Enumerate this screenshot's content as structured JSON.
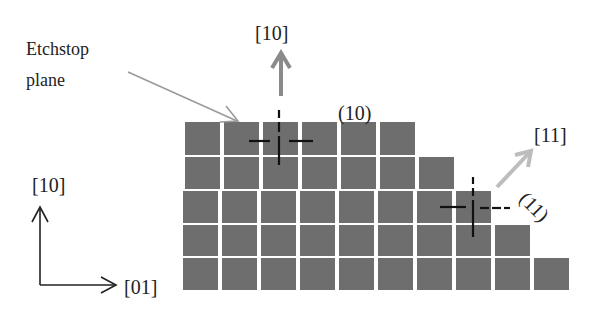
{
  "diagram": {
    "labels": {
      "etchstop_line1": "Etchstop",
      "etchstop_line2": "plane",
      "direction_top": "[10]",
      "plane_top": "(10)",
      "direction_diag": "[11]",
      "plane_diag": "(11)",
      "axis_y": "[10]",
      "axis_x": "[01]"
    },
    "lattice": {
      "rows": [
        6,
        7,
        8,
        9,
        10
      ],
      "description": "Staircase of square lattice atoms; each lower row has one more column"
    },
    "colors": {
      "atom": "#6e6e6e",
      "arrow_gray": "#8a8a8a",
      "arrow_light": "#bdbdbd",
      "pointer": "#9a9a9a",
      "crosshair": "#111111",
      "text": "#222222"
    }
  }
}
